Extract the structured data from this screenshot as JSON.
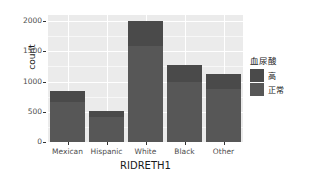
{
  "chart_data": {
    "type": "bar",
    "subtype": "stacked",
    "title": "",
    "xlabel": "RIDRETH1",
    "ylabel": "count",
    "categories": [
      "Mexican",
      "Hispanic",
      "White",
      "Black",
      "Other"
    ],
    "series": [
      {
        "name": "高",
        "values": [
          180,
          105,
          420,
          290,
          250
        ]
      },
      {
        "name": "正常",
        "values": [
          660,
          415,
          1580,
          990,
          880
        ]
      }
    ],
    "totals": [
      840,
      520,
      2000,
      1280,
      1130
    ],
    "ylim": [
      0,
      2100
    ],
    "y_ticks": [
      0,
      500,
      1000,
      1500,
      2000
    ],
    "y_tick_labels": [
      "0",
      "500",
      "1000",
      "1500",
      "2000"
    ],
    "y_minor_ticks": [
      250,
      750,
      1250,
      1750
    ],
    "grid": true,
    "legend": {
      "title": "血尿酸",
      "position": "right",
      "entries": [
        {
          "label": "高",
          "color": "#4a4a4a"
        },
        {
          "label": "正常",
          "color": "#575757"
        }
      ]
    },
    "panel_background": "#ebebeb",
    "gridline_color": "#ffffff"
  }
}
